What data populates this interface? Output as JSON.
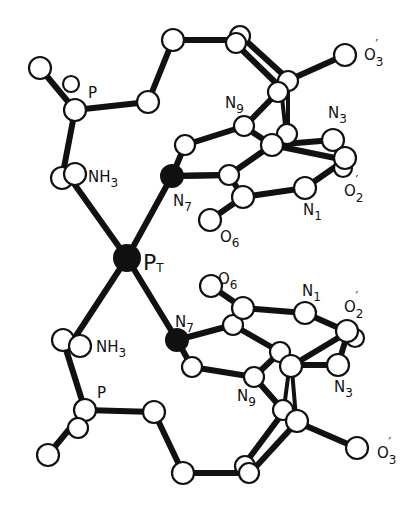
{
  "figure": {
    "type": "molecular-structure",
    "center_atom": {
      "symbol": "P",
      "subscript": "T"
    },
    "labels": {
      "pt_main": "P",
      "pt_sub": "T",
      "top": {
        "p": "P",
        "nh3_main": "NH",
        "nh3_sub": "3",
        "n7_main": "N",
        "n7_sub": "7",
        "n9_main": "N",
        "n9_sub": "9",
        "n3_main": "N",
        "n3_sub": "3",
        "n1_main": "N",
        "n1_sub": "1",
        "o6_main": "O",
        "o6_sub": "6",
        "o2_main": "O",
        "o2_sub": "2",
        "o2_prime": "′",
        "o3_main": "O",
        "o3_sub": "3",
        "o3_prime": "′"
      },
      "bottom": {
        "p": "P",
        "nh3_main": "NH",
        "nh3_sub": "3",
        "n7_main": "N",
        "n7_sub": "7",
        "n9_main": "N",
        "n9_sub": "9",
        "n3_main": "N",
        "n3_sub": "3",
        "n1_main": "N",
        "n1_sub": "1",
        "o6_main": "O",
        "o6_sub": "6",
        "o2_main": "O",
        "o2_sub": "2",
        "o2_prime": "′",
        "o3_main": "O",
        "o3_sub": "3",
        "o3_prime": "′"
      }
    }
  }
}
